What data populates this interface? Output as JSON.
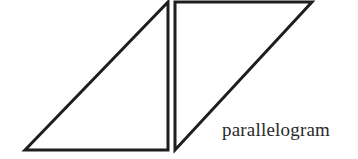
{
  "diagram": {
    "label": "parallelogram",
    "stroke_color": "#1e1e1e",
    "shapes": [
      {
        "name": "left-right-triangle",
        "points": [
          [
            25,
            150
          ],
          [
            168,
            2
          ],
          [
            168,
            150
          ]
        ]
      },
      {
        "name": "right-right-triangle",
        "points": [
          [
            175,
            2
          ],
          [
            312,
            2
          ],
          [
            175,
            150
          ]
        ]
      }
    ]
  }
}
